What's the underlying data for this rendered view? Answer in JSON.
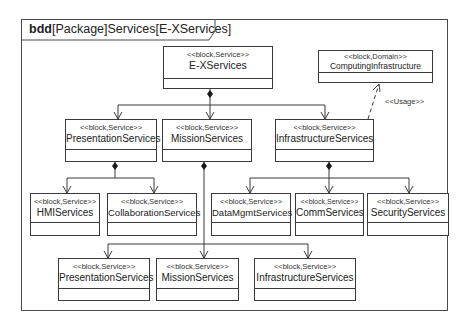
{
  "frame": {
    "kind": "bdd",
    "label_rest": "[Package]Services[E-XServices]"
  },
  "blocks": {
    "exservices": {
      "stereotype": "<<block,Service>>",
      "name": "E-XServices"
    },
    "computing": {
      "stereotype": "<<block,Domain>>",
      "name": "ComputingInfrastructure"
    },
    "presentation1": {
      "stereotype": "<<block,Service>>",
      "name": "PresentationServices"
    },
    "mission1": {
      "stereotype": "<<block,Service>>",
      "name": "MissionServices"
    },
    "infrastructure1": {
      "stereotype": "<<block,Service>>",
      "name": "InfrastructureServices"
    },
    "hmi": {
      "stereotype": "<<block,Service>>",
      "name": "HMIServices"
    },
    "collaboration": {
      "stereotype": "<<block,Service>>",
      "name": "CollaborationServices"
    },
    "datamgmt": {
      "stereotype": "<<block,Service>>",
      "name": "DataMgmtServices"
    },
    "comm": {
      "stereotype": "<<block,Service>>",
      "name": "CommServices"
    },
    "security": {
      "stereotype": "<<block,Service>>",
      "name": "SecurityServices"
    },
    "presentation2": {
      "stereotype": "<<block,Service>>",
      "name": "PresentationServices"
    },
    "mission2": {
      "stereotype": "<<block,Service>>",
      "name": "MissionServices"
    },
    "infrastructure2": {
      "stereotype": "<<block,Service>>",
      "name": "InfrastructureServices"
    }
  },
  "relations": {
    "usage_label": "<<Usage>>"
  },
  "colors": {
    "line": "#3a3a3a",
    "background": "#ffffff"
  }
}
